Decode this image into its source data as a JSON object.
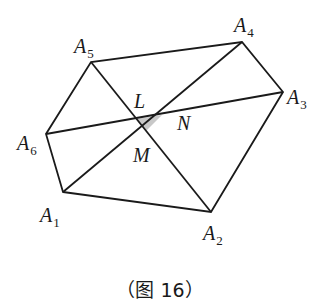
{
  "diagram": {
    "type": "hexagon with diagonals",
    "caption": "（图 16）",
    "colors": {
      "stroke": "#1a1a1a",
      "shade": "#c8c8c8",
      "background": "#ffffff"
    },
    "vertices": [
      {
        "name": "A",
        "sub": "1",
        "x": 63,
        "y": 192,
        "lx": 40,
        "ly": 222
      },
      {
        "name": "A",
        "sub": "2",
        "x": 211,
        "y": 212,
        "lx": 203,
        "ly": 240
      },
      {
        "name": "A",
        "sub": "3",
        "x": 283,
        "y": 92,
        "lx": 287,
        "ly": 104
      },
      {
        "name": "A",
        "sub": "4",
        "x": 242,
        "y": 42,
        "lx": 234,
        "ly": 32
      },
      {
        "name": "A",
        "sub": "5",
        "x": 91,
        "y": 62,
        "lx": 74,
        "ly": 53
      },
      {
        "name": "A",
        "sub": "6",
        "x": 46,
        "y": 134,
        "lx": 17,
        "ly": 150
      }
    ],
    "diagonals": [
      {
        "from": "A5",
        "to": "A2"
      },
      {
        "from": "A4",
        "to": "A1"
      },
      {
        "from": "A6",
        "to": "A3"
      }
    ],
    "points": [
      {
        "name": "L",
        "x": 136,
        "y": 119,
        "lx": 134,
        "ly": 108
      },
      {
        "name": "N",
        "x": 162,
        "y": 115,
        "lx": 177,
        "ly": 130
      },
      {
        "name": "M",
        "x": 146,
        "y": 131,
        "lx": 133,
        "ly": 162
      }
    ],
    "shaded_triangle": [
      "L",
      "N",
      "M"
    ]
  }
}
